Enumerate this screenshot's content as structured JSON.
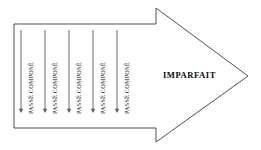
{
  "diagram": {
    "background_color": "#ffffff",
    "outline_color": "#4f4f4f",
    "text_color": "#0d0d0d",
    "arrow_shape": {
      "name": "right-pointing-block-arrow",
      "fill": "#ffffff",
      "stroke": "#4f4f4f",
      "stroke_width": 1,
      "points": "14,24 156,24 156,8 248,76 156,142 156,128 14,128"
    },
    "imparfait": {
      "label": "IMPARFAIT",
      "x": 163,
      "y": 71
    },
    "passe_compose_items": [
      {
        "label": "PASSÉ COMPOSÉ",
        "line_x": 21,
        "line_top": 30,
        "line_bottom": 113,
        "label_x": 28,
        "label_y": 114
      },
      {
        "label": "PASSÉ COMPOSÉ",
        "line_x": 45,
        "line_top": 30,
        "line_bottom": 113,
        "label_x": 52,
        "label_y": 114
      },
      {
        "label": "PASSÉ COMPOSÉ",
        "line_x": 69,
        "line_top": 30,
        "line_bottom": 113,
        "label_x": 76,
        "label_y": 114
      },
      {
        "label": "PASSÉ COMPOSÉ",
        "line_x": 93,
        "line_top": 30,
        "line_bottom": 113,
        "label_x": 100,
        "label_y": 114
      },
      {
        "label": "PASSÉ COMPOSÉ",
        "line_x": 117,
        "line_top": 30,
        "line_bottom": 113,
        "label_x": 124,
        "label_y": 114
      }
    ],
    "down_arrow_style": {
      "stroke": "#6a6a6a",
      "stroke_width": 1,
      "head_fill": "#5a5a5a",
      "head_half_width": 2.2,
      "head_height": 4.2
    }
  }
}
